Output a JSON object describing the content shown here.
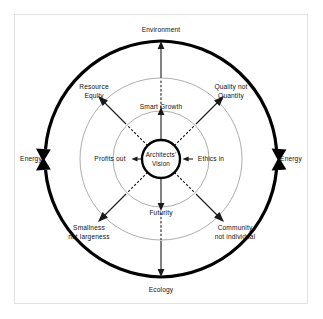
{
  "diagram": {
    "center": {
      "line1": "Architects'",
      "line2": "Vision"
    },
    "outer_cycle_labels": {
      "top": "Environment",
      "bottom": "Ecology",
      "left": "Energy",
      "right": "Energy"
    },
    "inner_axis_labels": {
      "top": "Smart Growth",
      "bottom": "Futurity",
      "left": "Profits out",
      "right": "Ethics in"
    },
    "diagonal_labels": {
      "top_left_line1": "Resource",
      "top_left_line2": "Equity",
      "top_right_line1": "Quality not",
      "top_right_line2": "Quantity",
      "bottom_left_line1": "Smallness",
      "bottom_left_line2": "not largeness",
      "bottom_right_line1": "Community",
      "bottom_right_line2": "not individual"
    },
    "colors": {
      "background": "#ffffff",
      "frame_border": "#e2e2e2",
      "ring_stroke": "#8a8a8a",
      "heavy_stroke": "#000000",
      "text": "#111111"
    },
    "geometry": {
      "center_x": 161,
      "center_y": 159,
      "core_radius": 19,
      "inner_ring_radius": 48,
      "outer_ring_radius": 81,
      "cycle_arc_radius": 118
    }
  }
}
